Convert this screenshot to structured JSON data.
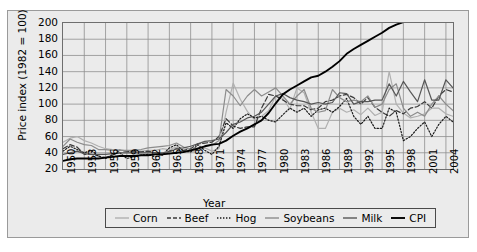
{
  "chart_data": {
    "type": "line",
    "title": "",
    "xlabel": "Year",
    "ylabel": "Price index (1982 = 100)",
    "xlim": [
      1950,
      2005
    ],
    "ylim": [
      20,
      200
    ],
    "yticks": [
      20,
      40,
      60,
      80,
      100,
      120,
      140,
      160,
      180,
      200
    ],
    "xticks": [
      1950,
      1953,
      1956,
      1959,
      1962,
      1965,
      1968,
      1971,
      1974,
      1977,
      1980,
      1983,
      1986,
      1989,
      1992,
      1995,
      1998,
      2001,
      2004
    ],
    "grid": true,
    "legend_position": "bottom",
    "x": [
      1950,
      1951,
      1952,
      1953,
      1954,
      1955,
      1956,
      1957,
      1958,
      1959,
      1960,
      1961,
      1962,
      1963,
      1964,
      1965,
      1966,
      1967,
      1968,
      1969,
      1970,
      1971,
      1972,
      1973,
      1974,
      1975,
      1976,
      1977,
      1978,
      1979,
      1980,
      1981,
      1982,
      1983,
      1984,
      1985,
      1986,
      1987,
      1988,
      1989,
      1990,
      1991,
      1992,
      1993,
      1994,
      1995,
      1996,
      1997,
      1998,
      1999,
      2000,
      2001,
      2002,
      2003,
      2004,
      2005
    ],
    "series": [
      {
        "name": "Corn",
        "color": "#b0b0b0",
        "style": "solid",
        "values": [
          53,
          58,
          60,
          55,
          52,
          48,
          45,
          44,
          44,
          42,
          41,
          42,
          43,
          43,
          45,
          44,
          47,
          42,
          41,
          43,
          46,
          42,
          45,
          90,
          126,
          106,
          91,
          81,
          85,
          92,
          110,
          107,
          94,
          120,
          114,
          90,
          70,
          70,
          90,
          95,
          90,
          93,
          87,
          95,
          86,
          90,
          140,
          100,
          89,
          83,
          85,
          88,
          95,
          95,
          88,
          85
        ]
      },
      {
        "name": "Beef",
        "color": "#3a3a3a",
        "style": "dashed",
        "values": [
          45,
          50,
          47,
          38,
          38,
          36,
          34,
          37,
          43,
          42,
          41,
          41,
          42,
          40,
          38,
          42,
          45,
          43,
          45,
          51,
          52,
          53,
          60,
          82,
          73,
          70,
          72,
          72,
          95,
          112,
          110,
          105,
          100,
          98,
          98,
          93,
          95,
          103,
          105,
          110,
          112,
          108,
          100,
          108,
          96,
          90,
          85,
          92,
          88,
          95,
          97,
          103,
          95,
          110,
          118,
          115
        ]
      },
      {
        "name": "Hog",
        "color": "#1a1a1a",
        "style": "dotted",
        "values": [
          42,
          48,
          44,
          40,
          43,
          36,
          33,
          38,
          40,
          33,
          35,
          37,
          38,
          35,
          37,
          46,
          50,
          42,
          41,
          50,
          43,
          38,
          48,
          77,
          70,
          82,
          88,
          83,
          85,
          80,
          78,
          87,
          95,
          90,
          95,
          85,
          93,
          95,
          90,
          97,
          107,
          85,
          75,
          85,
          70,
          70,
          95,
          90,
          55,
          60,
          70,
          78,
          60,
          75,
          85,
          78
        ]
      },
      {
        "name": "Soybeans",
        "color": "#8c8c8c",
        "style": "solid",
        "values": [
          48,
          57,
          53,
          50,
          49,
          44,
          44,
          43,
          43,
          43,
          43,
          44,
          46,
          47,
          48,
          49,
          52,
          47,
          44,
          46,
          48,
          49,
          55,
          118,
          110,
          98,
          110,
          118,
          110,
          115,
          120,
          110,
          100,
          110,
          118,
          95,
          90,
          92,
          118,
          108,
          103,
          105,
          103,
          110,
          96,
          100,
          118,
          125,
          95,
          85,
          90,
          85,
          100,
          110,
          100,
          92
        ]
      },
      {
        "name": "Milk",
        "color": "#565656",
        "style": "solid",
        "values": [
          38,
          40,
          42,
          39,
          38,
          38,
          38,
          39,
          40,
          40,
          40,
          40,
          40,
          40,
          40,
          41,
          45,
          46,
          48,
          51,
          54,
          55,
          57,
          65,
          75,
          78,
          83,
          85,
          90,
          100,
          110,
          113,
          108,
          105,
          103,
          100,
          102,
          100,
          102,
          114,
          113,
          100,
          103,
          103,
          105,
          105,
          125,
          110,
          128,
          115,
          103,
          130,
          105,
          105,
          130,
          120
        ]
      },
      {
        "name": "CPI",
        "color": "#000000",
        "style": "solid",
        "values": [
          30,
          32,
          33,
          33,
          33,
          33,
          34,
          35,
          36,
          36,
          36,
          37,
          37,
          38,
          38,
          39,
          40,
          41,
          43,
          45,
          48,
          50,
          51,
          55,
          61,
          66,
          70,
          75,
          80,
          89,
          101,
          112,
          118,
          123,
          128,
          133,
          135,
          140,
          146,
          153,
          162,
          168,
          173,
          178,
          183,
          188,
          194,
          198,
          201,
          206,
          213,
          219,
          222,
          228,
          234,
          242
        ]
      }
    ]
  },
  "legend": {
    "items": [
      {
        "label": "Corn",
        "color": "#b0b0b0",
        "style": "solid"
      },
      {
        "label": "Beef",
        "color": "#3a3a3a",
        "style": "dashed"
      },
      {
        "label": "Hog",
        "color": "#1a1a1a",
        "style": "dotted"
      },
      {
        "label": "Soybeans",
        "color": "#8c8c8c",
        "style": "solid"
      },
      {
        "label": "Milk",
        "color": "#565656",
        "style": "solid"
      },
      {
        "label": "CPI",
        "color": "#000000",
        "style": "solid"
      }
    ]
  },
  "axes": {
    "ylabel": "Price index (1982 = 100)",
    "xlabel": "Year"
  }
}
